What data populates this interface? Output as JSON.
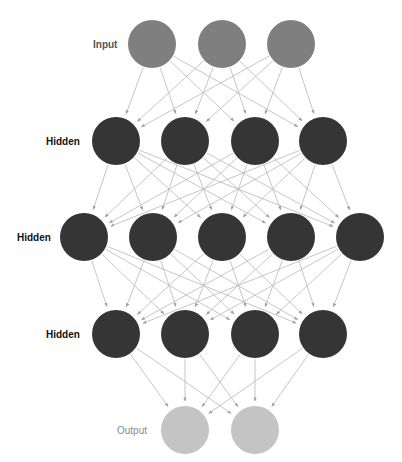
{
  "diagram": {
    "type": "feed-forward neural network",
    "colors": {
      "background": "#ffffff",
      "input_node": "#7f7f7f",
      "hidden_node": "#353535",
      "output_node": "#c4c4c4",
      "edge": "#b8b8b8",
      "arrowhead": "#a0a0a0"
    },
    "node_radius": 24,
    "layers": [
      {
        "label": "Input",
        "role": "input",
        "label_x": 93,
        "y": 44,
        "nodes_x": [
          152,
          222,
          291
        ]
      },
      {
        "label": "Hidden",
        "role": "hidden",
        "label_x": 46,
        "y": 141,
        "nodes_x": [
          116,
          185,
          255,
          323
        ]
      },
      {
        "label": "Hidden",
        "role": "hidden",
        "label_x": 17,
        "y": 237,
        "nodes_x": [
          84,
          153,
          222,
          291,
          360
        ]
      },
      {
        "label": "Hidden",
        "role": "hidden",
        "label_x": 46,
        "y": 334,
        "nodes_x": [
          116,
          185,
          255,
          323
        ]
      },
      {
        "label": "Output",
        "role": "output",
        "label_x": 117,
        "y": 430,
        "nodes_x": [
          185,
          255
        ]
      }
    ],
    "connectivity": "fully-connected between adjacent layers, arrows point downward"
  }
}
